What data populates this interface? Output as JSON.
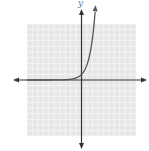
{
  "chart_data": {
    "type": "line",
    "title": "",
    "xlabel": "",
    "ylabel": "y",
    "xlim": [
      -10,
      10
    ],
    "ylim": [
      -10,
      10
    ],
    "grid": true,
    "grid_step": 1,
    "series": [
      {
        "name": "y = e^x",
        "x": [
          -10,
          -4,
          -3,
          -2,
          -1,
          0,
          1,
          1.5,
          2,
          2.3,
          2.6
        ],
        "y": [
          5e-05,
          0.018,
          0.05,
          0.135,
          0.368,
          1,
          2.718,
          4.48,
          7.39,
          9.97,
          13.46
        ]
      }
    ],
    "annotations": [
      "arrow at top of curve",
      "axis arrows on both ends"
    ]
  },
  "colors": {
    "grid_fill": "#e6e6e6",
    "grid_line": "#f8f8f8",
    "axis": "#333333",
    "curve": "#555555"
  },
  "labels": {
    "y_axis": "y"
  }
}
